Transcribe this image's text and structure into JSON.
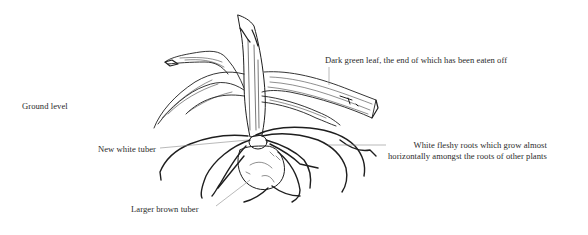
{
  "figure": {
    "labels": {
      "ground_level": "Ground level",
      "new_tuber": "New white tuber",
      "larger_tuber": "Larger brown tuber",
      "leaf": "Dark green leaf, the end of which has been eaten off",
      "roots_line1": "White fleshy roots which grow almost",
      "roots_line2": "horizontally amongst the roots of other plants"
    }
  }
}
